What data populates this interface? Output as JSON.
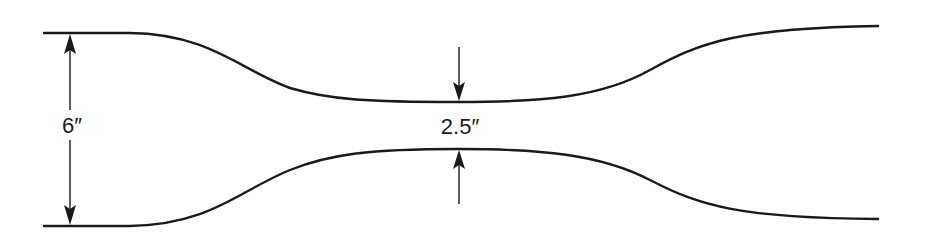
{
  "diagram": {
    "type": "venturi / converging-diverging duct profile",
    "dimensions": {
      "inlet_diameter": {
        "label": "6″",
        "value": 6,
        "unit": "in"
      },
      "throat_diameter": {
        "label": "2.5″",
        "value": 2.5,
        "unit": "in"
      }
    },
    "colors": {
      "line": "#1a1a1a",
      "background": "#ffffff"
    }
  }
}
